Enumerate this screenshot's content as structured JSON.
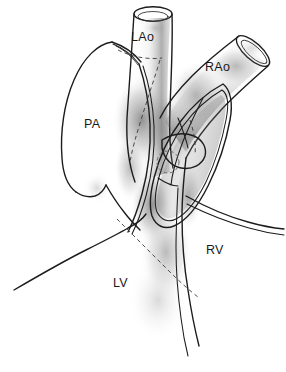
{
  "figure": {
    "medium": "black-ink line drawing with stipple shading",
    "background_color": "#ffffff",
    "ink_color": "#1c1c1c",
    "dash_color": "#3a3a3a",
    "stipple_color": "#555555",
    "width": 286,
    "height": 372
  },
  "labels": [
    {
      "id": "lao",
      "text": "LAo",
      "meaning": "left aorta",
      "x": 131,
      "y": 38
    },
    {
      "id": "rao",
      "text": "RAo",
      "meaning": "right aorta",
      "x": 205,
      "y": 68
    },
    {
      "id": "pa",
      "text": "PA",
      "meaning": "pulmonary artery",
      "x": 84,
      "y": 125
    },
    {
      "id": "rv",
      "text": "RV",
      "meaning": "right ventricle",
      "x": 206,
      "y": 251
    },
    {
      "id": "lv",
      "text": "LV",
      "meaning": "left ventricle",
      "x": 113,
      "y": 284
    }
  ],
  "structures": [
    {
      "id": "lao-trunk",
      "name": "left aortic trunk",
      "description": "vertical cut tube at top center with elliptical cut opening"
    },
    {
      "id": "rao-trunk",
      "name": "right aortic trunk",
      "description": "obliquely cut tube extending to upper right with elliptical opening"
    },
    {
      "id": "pa-trunk",
      "name": "pulmonary artery trunk",
      "description": "large cut vessel on the left with tapering superior tip"
    },
    {
      "id": "valve-cusps",
      "name": "semilunar valve cusps",
      "description": "opened valve leaflets in central window"
    },
    {
      "id": "ventricular-mass",
      "name": "ventricular mass",
      "description": "lower chamber walls forming LV and RV"
    },
    {
      "id": "septal-marker",
      "name": "dashed circular marker",
      "description": "small dashed circle within central window",
      "cx": 168,
      "cy": 162,
      "r": 11
    },
    {
      "id": "septal-dashes",
      "name": "dashed septal outlines",
      "description": "hidden-line dashed contours crossing LAo and ventricular septum"
    }
  ]
}
